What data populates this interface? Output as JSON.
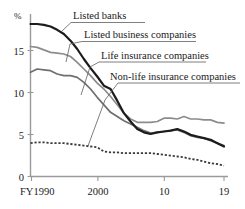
{
  "chart_data": {
    "type": "line",
    "title": "",
    "xlabel": "",
    "ylabel": "",
    "y_unit": "%",
    "grid": false,
    "legend_position": "inline-annotations",
    "xlim": [
      1990,
      2019
    ],
    "ylim": [
      0,
      19.5
    ],
    "x": [
      1990,
      1991,
      1992,
      1993,
      1994,
      1995,
      1996,
      1997,
      1998,
      1999,
      2000,
      2001,
      2002,
      2003,
      2004,
      2005,
      2006,
      2007,
      2008,
      2009,
      2010,
      2011,
      2012,
      2013,
      2014,
      2015,
      2016,
      2017,
      2018,
      2019
    ],
    "x_tick_values": [
      1990,
      2000,
      2010,
      2019
    ],
    "x_tick_labels": [
      "FY1990",
      "2000",
      "10",
      "19"
    ],
    "y_ticks": [
      0,
      5,
      10,
      15
    ],
    "y_tick_labels": [
      "0",
      "5",
      "10",
      "15"
    ],
    "series": [
      {
        "name": "Listed banks",
        "style": "solid-thick-black",
        "color": "#1c1c1c",
        "values": [
          18.3,
          18.3,
          18.2,
          18.0,
          17.6,
          17.1,
          16.3,
          15.3,
          14.1,
          13.0,
          12.0,
          10.9,
          10.5,
          9.1,
          7.6,
          6.6,
          5.7,
          5.3,
          5.1,
          5.3,
          5.4,
          5.5,
          5.7,
          5.4,
          5.0,
          4.8,
          4.6,
          4.4,
          4.0,
          3.6
        ]
      },
      {
        "name": "Listed business companies",
        "style": "solid-gray",
        "color": "#8c8c8c",
        "values": [
          15.6,
          15.5,
          15.2,
          14.9,
          14.8,
          14.7,
          14.4,
          13.7,
          12.9,
          12.1,
          11.2,
          10.5,
          9.6,
          8.6,
          7.6,
          6.9,
          6.5,
          6.5,
          6.5,
          6.6,
          7.0,
          7.0,
          6.9,
          7.2,
          6.9,
          6.9,
          6.8,
          6.8,
          6.5,
          6.4
        ]
      },
      {
        "name": "Life insurance companies",
        "style": "solid-gray",
        "color": "#6f6f6f",
        "values": [
          12.5,
          12.9,
          12.8,
          12.7,
          12.3,
          12.1,
          12.1,
          11.9,
          11.3,
          10.5,
          9.5,
          8.6,
          7.7,
          7.2,
          6.7,
          6.3,
          5.9,
          5.5,
          5.2,
          5.3,
          5.4,
          5.5,
          5.6,
          5.3,
          4.9,
          4.7,
          4.6,
          4.3,
          4.0,
          3.7
        ]
      },
      {
        "name": "Non-life insurance companies",
        "style": "dotted",
        "color": "#3a3a3a",
        "values": [
          4.0,
          4.1,
          4.1,
          4.0,
          4.0,
          4.0,
          3.9,
          3.8,
          3.7,
          3.6,
          3.5,
          3.0,
          2.9,
          2.9,
          2.8,
          2.8,
          2.8,
          2.8,
          2.8,
          2.7,
          2.6,
          2.5,
          2.4,
          2.3,
          2.1,
          2.0,
          1.8,
          1.6,
          1.5,
          1.3
        ]
      }
    ],
    "annotations": [
      {
        "id": "ann-listed-banks",
        "label": "Listed banks",
        "target_series": "Listed banks"
      },
      {
        "id": "ann-listed-business",
        "label": "Listed business companies",
        "target_series": "Listed business companies"
      },
      {
        "id": "ann-life-insurance",
        "label": "Life insurance companies",
        "target_series": "Life insurance companies"
      },
      {
        "id": "ann-nonlife-insurance",
        "label": "Non-life insurance companies",
        "target_series": "Non-life insurance companies"
      }
    ]
  },
  "axes": {
    "y_unit_label": "%",
    "y_tick_15": "15",
    "y_tick_10": "10",
    "y_tick_5": "5",
    "y_tick_0": "0",
    "x_tick_1990": "FY1990",
    "x_tick_2000": "2000",
    "x_tick_2010": "10",
    "x_tick_2019": "19"
  },
  "labels": {
    "listed_banks": "Listed banks",
    "listed_business_companies": "Listed business companies",
    "life_insurance_companies": "Life insurance companies",
    "nonlife_insurance_companies": "Non-life insurance companies"
  }
}
